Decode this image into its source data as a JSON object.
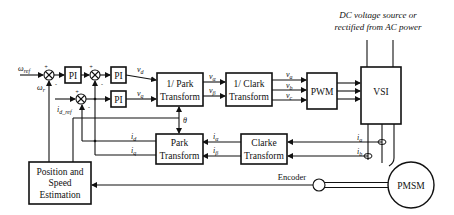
{
  "annotation": {
    "line1": "DC voltage source or",
    "line2": "rectified from AC power"
  },
  "blocks": {
    "pi1": "PI",
    "pi2": "PI",
    "pi3": "PI",
    "inv_park": {
      "line1": "1/ Park",
      "line2": "Transform"
    },
    "inv_clark": {
      "line1": "1/ Clark",
      "line2": "Transform"
    },
    "pwm": "PWM",
    "vsi": "VSI",
    "park": {
      "line1": "Park",
      "line2": "Transform"
    },
    "clarke": {
      "line1": "Clarke",
      "line2": "Transform"
    },
    "estimator": {
      "line1": "Position and",
      "line2": "Speed",
      "line3": "Estimation"
    },
    "pmsm": "PMSM",
    "encoder": "Encoder"
  },
  "signals": {
    "omega_ref": {
      "base": "ω",
      "sub": "ref"
    },
    "omega_r": {
      "base": "ω",
      "sub": "r"
    },
    "id_ref": {
      "base": "i",
      "sub": "d_ref"
    },
    "vd": {
      "base": "v",
      "sub": "d"
    },
    "vq": {
      "base": "v",
      "sub": "q"
    },
    "valpha": {
      "base": "v",
      "sub": "α"
    },
    "vbeta": {
      "base": "v",
      "sub": "β"
    },
    "va": {
      "base": "v",
      "sub": "a"
    },
    "vb": {
      "base": "v",
      "sub": "b"
    },
    "vc": {
      "base": "v",
      "sub": "c"
    },
    "theta": "θ",
    "id": {
      "base": "i",
      "sub": "d"
    },
    "iq": {
      "base": "i",
      "sub": "q"
    },
    "ialpha": {
      "base": "i",
      "sub": "α"
    },
    "ibeta": {
      "base": "i",
      "sub": "β"
    },
    "ia": {
      "base": "i",
      "sub": "a"
    },
    "ib": {
      "base": "i",
      "sub": "b"
    }
  },
  "signs": {
    "plus": "+",
    "minus": "-"
  }
}
